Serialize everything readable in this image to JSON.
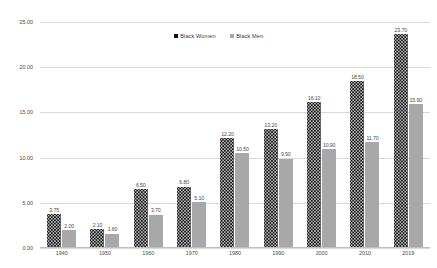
{
  "chart_data": {
    "type": "bar",
    "title": "",
    "xlabel": "",
    "ylabel": "",
    "categories": [
      "1940",
      "1950",
      "1960",
      "1970",
      "1980",
      "1990",
      "2000",
      "2010",
      "2019"
    ],
    "series": [
      {
        "name": "Black Women",
        "color": "#0d0d0d",
        "values": [
          3.75,
          2.1,
          6.5,
          6.8,
          12.2,
          13.2,
          16.1,
          18.5,
          23.7
        ],
        "labels": [
          "3.75",
          "2.10",
          "6.50",
          "6.80",
          "12.20",
          "13.20",
          "16.10",
          "18.50",
          "23.70"
        ]
      },
      {
        "name": "Black Men",
        "color": "#a8a8a8",
        "values": [
          2.0,
          1.6,
          3.7,
          5.1,
          10.5,
          9.9,
          10.9,
          11.7,
          15.9
        ],
        "labels": [
          "2.00",
          "1.60",
          "3.70",
          "5.10",
          "10.50",
          "9.90",
          "10.90",
          "11.70",
          "15.90"
        ]
      }
    ],
    "ylim": [
      0,
      25
    ],
    "yticks": [
      0,
      5,
      10,
      15,
      20,
      25
    ],
    "ytick_labels": [
      "0.00",
      "5.00",
      "10.00",
      "15.00",
      "20.00",
      "25.00"
    ],
    "grid": true,
    "legend_position": "top-center"
  },
  "legend": {
    "entries": [
      {
        "label": "Black Women"
      },
      {
        "label": "Black Men"
      }
    ]
  }
}
